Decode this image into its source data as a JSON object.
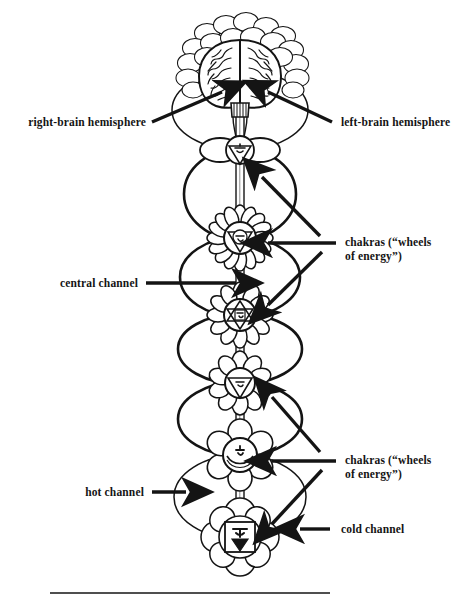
{
  "figure": {
    "background_color": "#ffffff",
    "ink_color": "#141414",
    "rule": {
      "present": true,
      "x1": 50,
      "x2": 330,
      "y": 593
    }
  },
  "labels": {
    "right_brain": "right-brain hemisphere",
    "left_brain": "left-brain hemisphere",
    "central_channel": "central channel",
    "hot_channel": "hot channel",
    "cold_channel": "cold channel",
    "chakras_upper": "chakras (“wheels\nof energy”)",
    "chakras_lower": "chakras (“wheels\nof energy”)"
  },
  "anatomy": {
    "brain": {
      "name": "brain",
      "view": "frontal",
      "halo": "crown-chakra-petals"
    },
    "central_channel": {
      "name": "central-channel",
      "style": "double-line-tube"
    },
    "side_channels": [
      {
        "name": "hot-channel",
        "side": "left"
      },
      {
        "name": "cold-channel",
        "side": "right"
      }
    ],
    "chakras": [
      {
        "name": "crown-chakra",
        "sanskrit": "Sahasrara",
        "petals": 1000,
        "cy": 60
      },
      {
        "name": "third-eye-chakra",
        "sanskrit": "Ajna",
        "petals": 2,
        "cy": 150
      },
      {
        "name": "throat-chakra",
        "sanskrit": "Vishuddha",
        "petals": 16,
        "cy": 238
      },
      {
        "name": "heart-chakra",
        "sanskrit": "Anahata",
        "petals": 12,
        "cy": 315
      },
      {
        "name": "solar-plexus-chakra",
        "sanskrit": "Manipura",
        "petals": 10,
        "cy": 383
      },
      {
        "name": "sacral-chakra",
        "sanskrit": "Svadhisthana",
        "petals": 6,
        "cy": 455
      },
      {
        "name": "root-chakra",
        "sanskrit": "Muladhara",
        "petals": 4,
        "cy": 537
      }
    ]
  }
}
